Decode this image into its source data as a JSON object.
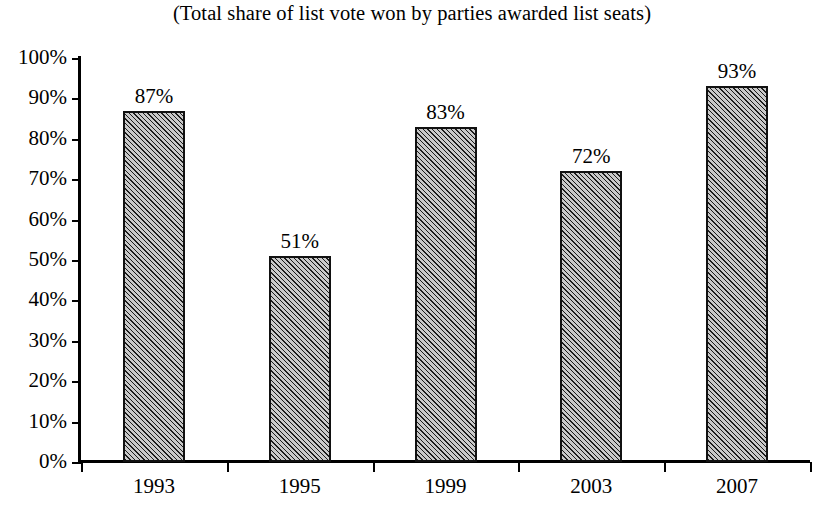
{
  "chart_data": {
    "type": "bar",
    "title": "(Total share of list vote won by parties awarded list seats)",
    "xlabel": "",
    "ylabel": "",
    "categories": [
      "1993",
      "1995",
      "1999",
      "2003",
      "2007"
    ],
    "values": [
      87,
      51,
      83,
      72,
      93
    ],
    "value_labels": [
      "87%",
      "51%",
      "83%",
      "72%",
      "93%"
    ],
    "ylim": [
      0,
      100
    ],
    "ytick_labels": [
      "100%",
      "90%",
      "80%",
      "70%",
      "60%",
      "50%",
      "40%",
      "30%",
      "20%",
      "10%",
      "0%"
    ],
    "ytick_values": [
      100,
      90,
      80,
      70,
      60,
      50,
      40,
      30,
      20,
      10,
      0
    ],
    "grid": false,
    "legend": null,
    "series": [
      {
        "name": "Share of list vote won by parties awarded list seats",
        "values": [
          87,
          51,
          83,
          72,
          93
        ]
      }
    ],
    "colors": {
      "bar_fill": "#c9c9c9",
      "bar_hatch": "#1c1c1c",
      "bar_border": "#111111",
      "axis": "#000000",
      "text": "#000000",
      "background": "#ffffff"
    }
  }
}
